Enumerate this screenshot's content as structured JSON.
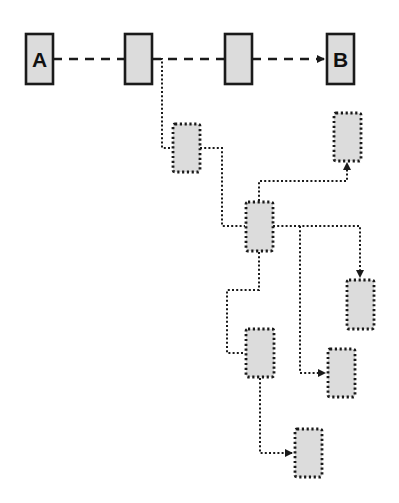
{
  "diagram": {
    "colors": {
      "box_fill": "#dcdcdc",
      "stroke": "#1a1a1a",
      "background": "#ffffff"
    },
    "main_path": {
      "style": "dashed",
      "nodes": [
        {
          "id": "A",
          "label": "A"
        },
        {
          "id": "n2",
          "label": ""
        },
        {
          "id": "n3",
          "label": ""
        },
        {
          "id": "B",
          "label": "B"
        }
      ],
      "arrow_into": "B"
    },
    "branch_nodes": [
      {
        "id": "d1",
        "label": ""
      },
      {
        "id": "d2",
        "label": ""
      },
      {
        "id": "d3",
        "label": ""
      },
      {
        "id": "d4",
        "label": ""
      },
      {
        "id": "d5",
        "label": ""
      },
      {
        "id": "d6",
        "label": ""
      },
      {
        "id": "d7",
        "label": ""
      }
    ],
    "branch_edges": [
      {
        "from": "n2",
        "to": "d1",
        "style": "dotted",
        "arrow": false
      },
      {
        "from": "d1",
        "to": "d3",
        "style": "dotted",
        "arrow": false
      },
      {
        "from": "d3",
        "to": "d2",
        "style": "dotted",
        "arrow": true
      },
      {
        "from": "d3",
        "to": "d4",
        "style": "dotted",
        "arrow": true
      },
      {
        "from": "d3",
        "to": "d6",
        "style": "dotted",
        "arrow": true
      },
      {
        "from": "d3",
        "to": "d5",
        "style": "dotted",
        "arrow": false
      },
      {
        "from": "d5",
        "to": "d7",
        "style": "dotted",
        "arrow": true
      }
    ]
  }
}
